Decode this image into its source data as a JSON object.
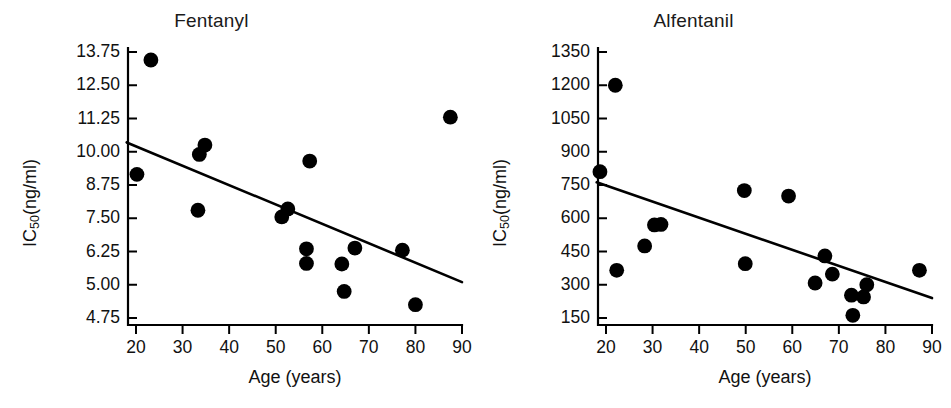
{
  "figure": {
    "background": "#ffffff",
    "ink": "#000000",
    "width": 951,
    "height": 408
  },
  "chart_data": [
    {
      "type": "scatter",
      "title": "Fentanyl",
      "xlabel": "Age (years)",
      "ylabel_text": "IC",
      "ylabel_sub": "50",
      "ylabel_tail": "(ng/ml)",
      "ylabel_full": "IC50(ng/ml)",
      "xlim": [
        18,
        90
      ],
      "ylim": [
        4.3,
        13.95
      ],
      "grid": false,
      "legend": "none",
      "xticks": [
        20,
        30,
        40,
        50,
        60,
        70,
        80,
        90
      ],
      "xtick_labels": [
        "20",
        "30",
        "40",
        "50",
        "60",
        "70",
        "80",
        "90"
      ],
      "yticks": [
        13.75,
        12.5,
        11.25,
        10.0,
        8.75,
        7.5,
        6.25,
        5.0,
        4.75
      ],
      "ytick_labels": [
        "13.75",
        "12.50",
        "11.25",
        "10.00",
        "8.75",
        "7.50",
        "6.25",
        "5.00",
        "4.75"
      ],
      "points": [
        {
          "x": 20.2,
          "y": 9.15
        },
        {
          "x": 23.2,
          "y": 13.45
        },
        {
          "x": 33.3,
          "y": 7.8
        },
        {
          "x": 33.6,
          "y": 9.9
        },
        {
          "x": 34.8,
          "y": 10.25
        },
        {
          "x": 51.3,
          "y": 7.55
        },
        {
          "x": 52.6,
          "y": 7.85
        },
        {
          "x": 56.6,
          "y": 6.35
        },
        {
          "x": 56.6,
          "y": 5.8
        },
        {
          "x": 57.3,
          "y": 9.65
        },
        {
          "x": 64.2,
          "y": 5.78
        },
        {
          "x": 64.7,
          "y": 4.95
        },
        {
          "x": 67.0,
          "y": 6.38
        },
        {
          "x": 77.2,
          "y": 6.3
        },
        {
          "x": 80.0,
          "y": 4.85
        },
        {
          "x": 87.5,
          "y": 11.3
        }
      ],
      "fit_line": {
        "x1": 18,
        "y1": 10.35,
        "x2": 90,
        "y2": 5.1
      }
    },
    {
      "type": "scatter",
      "title": "Alfentanil",
      "xlabel": "Age (years)",
      "ylabel_text": "IC",
      "ylabel_sub": "50",
      "ylabel_tail": "(ng/ml)",
      "ylabel_full": "IC50(ng/ml)",
      "xlim": [
        18,
        90
      ],
      "ylim": [
        60,
        1395
      ],
      "grid": false,
      "legend": "none",
      "xticks": [
        20,
        30,
        40,
        50,
        60,
        70,
        80,
        90
      ],
      "xtick_labels": [
        "20",
        "30",
        "40",
        "50",
        "60",
        "70",
        "80",
        "90"
      ],
      "yticks": [
        1350,
        1200,
        1050,
        900,
        750,
        600,
        450,
        300,
        150
      ],
      "ytick_labels": [
        "1350",
        "1200",
        "1050",
        "900",
        "750",
        "600",
        "450",
        "300",
        "150"
      ],
      "points": [
        {
          "x": 18.7,
          "y": 810
        },
        {
          "x": 22.0,
          "y": 1200
        },
        {
          "x": 22.3,
          "y": 365
        },
        {
          "x": 28.3,
          "y": 475
        },
        {
          "x": 30.4,
          "y": 570
        },
        {
          "x": 31.8,
          "y": 572
        },
        {
          "x": 49.7,
          "y": 725
        },
        {
          "x": 49.9,
          "y": 395
        },
        {
          "x": 59.2,
          "y": 700
        },
        {
          "x": 64.9,
          "y": 308
        },
        {
          "x": 67.0,
          "y": 430
        },
        {
          "x": 68.6,
          "y": 348
        },
        {
          "x": 72.7,
          "y": 253
        },
        {
          "x": 73.0,
          "y": 162
        },
        {
          "x": 75.3,
          "y": 245
        },
        {
          "x": 76.0,
          "y": 300
        },
        {
          "x": 87.3,
          "y": 365
        }
      ],
      "fit_line": {
        "x1": 18,
        "y1": 762,
        "x2": 90,
        "y2": 240
      }
    }
  ]
}
